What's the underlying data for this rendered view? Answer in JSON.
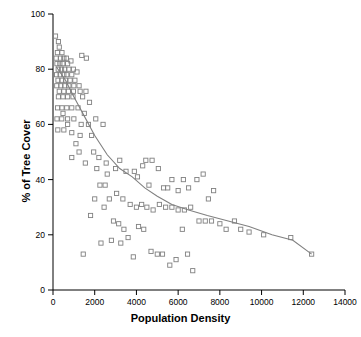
{
  "chart_data": {
    "type": "scatter",
    "title": "",
    "xlabel": "Population Density",
    "ylabel": "% of Tree Cover",
    "xlim": [
      0,
      14000
    ],
    "ylim": [
      0,
      100
    ],
    "xticks": [
      0,
      2000,
      4000,
      6000,
      8000,
      10000,
      12000,
      14000
    ],
    "yticks": [
      0,
      20,
      40,
      60,
      80,
      100
    ],
    "grid": false,
    "legend": null,
    "marker": "open-square",
    "marker_color": "#808080",
    "trend_color": "#808080",
    "points": [
      [
        120,
        92
      ],
      [
        260,
        90
      ],
      [
        300,
        88
      ],
      [
        210,
        86
      ],
      [
        430,
        86
      ],
      [
        150,
        84
      ],
      [
        360,
        84
      ],
      [
        520,
        84
      ],
      [
        640,
        84
      ],
      [
        190,
        82
      ],
      [
        330,
        82
      ],
      [
        470,
        82
      ],
      [
        700,
        82
      ],
      [
        860,
        83
      ],
      [
        250,
        80
      ],
      [
        410,
        80
      ],
      [
        560,
        80
      ],
      [
        760,
        80
      ],
      [
        980,
        80
      ],
      [
        170,
        78
      ],
      [
        340,
        78
      ],
      [
        520,
        78
      ],
      [
        660,
        78
      ],
      [
        900,
        78
      ],
      [
        1150,
        79
      ],
      [
        240,
        76
      ],
      [
        420,
        76
      ],
      [
        600,
        76
      ],
      [
        820,
        76
      ],
      [
        1050,
        76
      ],
      [
        1380,
        85
      ],
      [
        1600,
        84
      ],
      [
        180,
        74
      ],
      [
        380,
        74
      ],
      [
        560,
        74
      ],
      [
        760,
        74
      ],
      [
        1000,
        74
      ],
      [
        1250,
        74
      ],
      [
        300,
        72
      ],
      [
        520,
        72
      ],
      [
        740,
        72
      ],
      [
        980,
        72
      ],
      [
        1300,
        72
      ],
      [
        1580,
        72
      ],
      [
        260,
        70
      ],
      [
        480,
        70
      ],
      [
        700,
        70
      ],
      [
        960,
        70
      ],
      [
        1420,
        70
      ],
      [
        1750,
        68
      ],
      [
        220,
        66
      ],
      [
        430,
        66
      ],
      [
        660,
        66
      ],
      [
        900,
        66
      ],
      [
        1200,
        66
      ],
      [
        1500,
        64
      ],
      [
        190,
        62
      ],
      [
        420,
        62
      ],
      [
        700,
        62
      ],
      [
        1000,
        62
      ],
      [
        1350,
        60
      ],
      [
        1700,
        60
      ],
      [
        2050,
        62
      ],
      [
        230,
        58
      ],
      [
        520,
        58
      ],
      [
        900,
        57
      ],
      [
        1300,
        56
      ],
      [
        1850,
        56
      ],
      [
        2400,
        60
      ],
      [
        1950,
        50
      ],
      [
        2200,
        48
      ],
      [
        2550,
        46
      ],
      [
        2100,
        44
      ],
      [
        2600,
        42
      ],
      [
        3000,
        44
      ],
      [
        3200,
        47
      ],
      [
        3500,
        43
      ],
      [
        3900,
        43
      ],
      [
        4050,
        41
      ],
      [
        4300,
        45
      ],
      [
        4450,
        47
      ],
      [
        4600,
        38
      ],
      [
        4750,
        47
      ],
      [
        5050,
        44
      ],
      [
        5300,
        37
      ],
      [
        5500,
        37
      ],
      [
        5700,
        40
      ],
      [
        6000,
        36
      ],
      [
        6250,
        40
      ],
      [
        6500,
        37
      ],
      [
        6900,
        40
      ],
      [
        7200,
        42
      ],
      [
        7450,
        33
      ],
      [
        7700,
        36
      ],
      [
        3050,
        35
      ],
      [
        3350,
        33
      ],
      [
        3700,
        31
      ],
      [
        4000,
        30
      ],
      [
        4250,
        31
      ],
      [
        4500,
        30
      ],
      [
        4800,
        29
      ],
      [
        5100,
        31
      ],
      [
        5400,
        30
      ],
      [
        5700,
        30
      ],
      [
        6000,
        29
      ],
      [
        6300,
        29
      ],
      [
        6600,
        30
      ],
      [
        7000,
        25
      ],
      [
        7300,
        25
      ],
      [
        7600,
        25
      ],
      [
        8000,
        24
      ],
      [
        8300,
        22
      ],
      [
        8700,
        25
      ],
      [
        9000,
        22
      ],
      [
        9400,
        21
      ],
      [
        10100,
        20
      ],
      [
        11400,
        19
      ],
      [
        12400,
        13
      ],
      [
        1450,
        13
      ],
      [
        2450,
        30
      ],
      [
        2700,
        33
      ],
      [
        2900,
        25
      ],
      [
        3150,
        24
      ],
      [
        3400,
        22
      ],
      [
        3600,
        19
      ],
      [
        3850,
        12
      ],
      [
        4100,
        23
      ],
      [
        4350,
        22
      ],
      [
        4700,
        14
      ],
      [
        5000,
        13
      ],
      [
        5250,
        13
      ],
      [
        5600,
        9
      ],
      [
        5900,
        11
      ],
      [
        6200,
        22
      ],
      [
        6450,
        13
      ],
      [
        6700,
        7
      ],
      [
        2300,
        17
      ],
      [
        2800,
        18
      ],
      [
        3250,
        17
      ],
      [
        1800,
        27
      ],
      [
        2000,
        33
      ],
      [
        2250,
        38
      ],
      [
        2500,
        38
      ],
      [
        900,
        48
      ],
      [
        1100,
        53
      ],
      [
        1250,
        50
      ],
      [
        1550,
        46
      ],
      [
        700,
        60
      ],
      [
        480,
        64
      ]
    ],
    "trend_line": [
      [
        150,
        81
      ],
      [
        600,
        76
      ],
      [
        1000,
        70
      ],
      [
        1500,
        63
      ],
      [
        2000,
        56
      ],
      [
        2600,
        49
      ],
      [
        3200,
        44
      ],
      [
        3800,
        41
      ],
      [
        4400,
        37
      ],
      [
        5000,
        34
      ],
      [
        5700,
        31
      ],
      [
        6500,
        29
      ],
      [
        7400,
        27
      ],
      [
        8400,
        25
      ],
      [
        9400,
        23
      ],
      [
        10500,
        20
      ],
      [
        11500,
        18
      ],
      [
        12400,
        13
      ]
    ]
  },
  "axes": {
    "x_title": "Population Density",
    "y_title": "% of Tree Cover",
    "x_tick_labels": [
      "0",
      "2000",
      "4000",
      "6000",
      "8000",
      "10000",
      "14000"
    ],
    "x_tick_label_12000": "12000",
    "y_tick_labels": [
      "0",
      "20",
      "40",
      "60",
      "80",
      "100"
    ]
  }
}
